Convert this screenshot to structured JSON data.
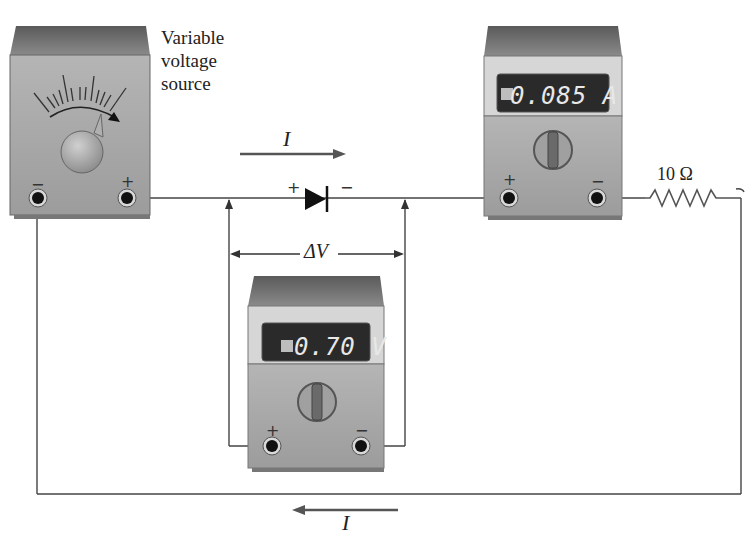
{
  "figure": {
    "type": "circuit-diagram"
  },
  "source": {
    "label": "Variable voltage source",
    "terminal_neg": "−",
    "terminal_pos": "+"
  },
  "ammeter": {
    "reading": "0.085 A",
    "terminal_pos": "+",
    "terminal_neg": "−"
  },
  "voltmeter": {
    "reading": "0.70 V",
    "terminal_pos": "+",
    "terminal_neg": "−"
  },
  "diode": {
    "plus": "+",
    "minus": "−"
  },
  "resistor": {
    "label": "10 Ω"
  },
  "labels": {
    "current_top": "I",
    "current_bottom": "I",
    "delta_v": "ΔV"
  },
  "colors": {
    "meter_body": "#a9a9a9",
    "meter_top": "#6a6a6a",
    "display_bg": "#2a2a2a",
    "wire": "#444444"
  }
}
